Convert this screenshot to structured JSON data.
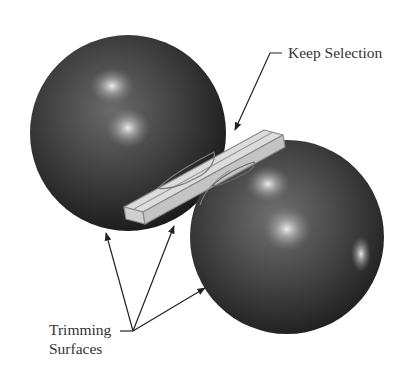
{
  "figure": {
    "colors": {
      "background": "#ffffff",
      "sphere_dark": "#1e1e1e",
      "sphere_mid": "#4a4a4a",
      "highlight": "#e8e8e8",
      "plate_fill": "#d9d9d9",
      "plate_edge": "#8a8a8a",
      "leader": "#222222",
      "text": "#333333"
    },
    "objects": [
      {
        "name": "left-sphere",
        "shape": "sphere"
      },
      {
        "name": "right-sphere",
        "shape": "sphere"
      },
      {
        "name": "plate",
        "shape": "thin rectangular solid"
      }
    ]
  },
  "callouts": {
    "keep_selection": {
      "label": "Keep Selection",
      "target": "plate"
    },
    "trimming_surfaces": {
      "line1": "Trimming",
      "line2": "Surfaces",
      "targets": [
        "left-sphere",
        "plate",
        "right-sphere"
      ]
    }
  }
}
